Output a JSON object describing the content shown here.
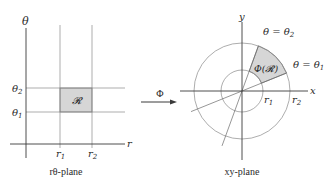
{
  "left_panel": {
    "caption": "rθ-plane",
    "axis_vertical_label": "θ",
    "axis_horizontal_label": "r",
    "theta1_label": "θ",
    "theta1_sub": "1",
    "theta2_label": "θ",
    "theta2_sub": "2",
    "r1_label": "r",
    "r1_sub": "1",
    "r2_label": "r",
    "r2_sub": "2",
    "region_label": "𝓡"
  },
  "mapping": {
    "label": "Φ"
  },
  "right_panel": {
    "caption": "xy-plane",
    "axis_x_label": "x",
    "axis_y_label": "y",
    "ray_theta2_label": "θ = θ",
    "ray_theta2_sub": "2",
    "ray_theta1_label": "θ = θ",
    "ray_theta1_sub": "1",
    "r1_label": "r",
    "r1_sub": "1",
    "r2_label": "r",
    "r2_sub": "2",
    "region_label": "Φ(𝓡)"
  },
  "colors": {
    "line": "#7a7a7a",
    "axis": "#3a3a3a",
    "region_fill": "#d6d6d6",
    "text": "#2a2a2a"
  }
}
